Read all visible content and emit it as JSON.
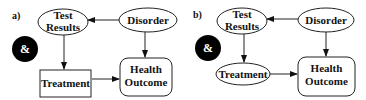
{
  "panels": [
    {
      "label": "a)",
      "nodes": {
        "test_results": {
          "line1": "Test",
          "line2": "Results",
          "shape": "ellipse"
        },
        "disorder": {
          "label": "Disorder",
          "shape": "ellipse"
        },
        "ampersand": {
          "label": "&",
          "shape": "filled-circle"
        },
        "treatment": {
          "label": "Treatment",
          "shape": "rectangle"
        },
        "health_outcome": {
          "line1": "Health",
          "line2": "Outcome",
          "shape": "rounded-rectangle"
        }
      },
      "edges": [
        {
          "from": "Disorder",
          "to": "Test Results"
        },
        {
          "from": "Test Results",
          "to": "Treatment"
        },
        {
          "from": "Disorder",
          "to": "Health Outcome"
        },
        {
          "from": "Treatment",
          "to": "Health Outcome"
        }
      ]
    },
    {
      "label": "b)",
      "nodes": {
        "test_results": {
          "line1": "Test",
          "line2": "Results",
          "shape": "ellipse"
        },
        "disorder": {
          "label": "Disorder",
          "shape": "ellipse"
        },
        "ampersand": {
          "label": "&",
          "shape": "filled-circle"
        },
        "treatment": {
          "label": "Treatment",
          "shape": "ellipse"
        },
        "health_outcome": {
          "line1": "Health",
          "line2": "Outcome",
          "shape": "rounded-rectangle"
        }
      },
      "edges": [
        {
          "from": "Disorder",
          "to": "Test Results"
        },
        {
          "from": "Test Results",
          "to": "Treatment"
        },
        {
          "from": "Disorder",
          "to": "Health Outcome"
        },
        {
          "from": "Treatment",
          "to": "Health Outcome"
        }
      ]
    }
  ],
  "colors": {
    "stroke": "#222222",
    "fill": "#ffffff",
    "ampersand_fill": "#000000"
  }
}
